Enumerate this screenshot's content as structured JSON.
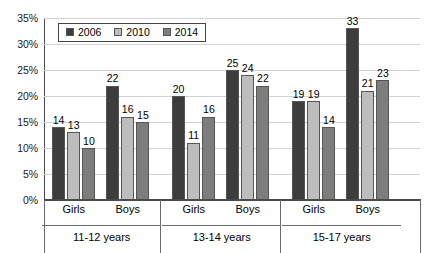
{
  "chart_data": {
    "type": "bar",
    "title": "",
    "subtitle": "",
    "xlabel": "",
    "ylabel": "",
    "ylim": [
      0,
      35
    ],
    "ytick_labels": [
      "0%",
      "5%",
      "10%",
      "15%",
      "20%",
      "25%",
      "30%",
      "35%"
    ],
    "ytick_values": [
      0,
      5,
      10,
      15,
      20,
      25,
      30,
      35
    ],
    "grid": true,
    "legend_position": "top-left-inside",
    "value_labels": true,
    "categories": [
      "Girls",
      "Boys",
      "Girls",
      "Boys",
      "Girls",
      "Boys"
    ],
    "group_labels": [
      "11-12 years",
      "13-14 years",
      "15-17 years"
    ],
    "series": [
      {
        "name": "2006",
        "color": "#3d3d3d",
        "values": [
          14,
          22,
          20,
          25,
          19,
          33
        ]
      },
      {
        "name": "2010",
        "color": "#bdbdbd",
        "values": [
          13,
          16,
          11,
          24,
          19,
          21
        ]
      },
      {
        "name": "2014",
        "color": "#7d7d7d",
        "values": [
          10,
          15,
          16,
          22,
          14,
          23
        ]
      }
    ],
    "groups": [
      {
        "age": "11-12 years",
        "sexes": [
          {
            "sex": "Girls",
            "bars": [
              {
                "year": "2006",
                "value": 14
              },
              {
                "year": "2010",
                "value": 13
              },
              {
                "year": "2014",
                "value": 10
              }
            ]
          },
          {
            "sex": "Boys",
            "bars": [
              {
                "year": "2006",
                "value": 22
              },
              {
                "year": "2010",
                "value": 16
              },
              {
                "year": "2014",
                "value": 15
              }
            ]
          }
        ]
      },
      {
        "age": "13-14 years",
        "sexes": [
          {
            "sex": "Girls",
            "bars": [
              {
                "year": "2006",
                "value": 20
              },
              {
                "year": "2010",
                "value": 11
              },
              {
                "year": "2014",
                "value": 16
              }
            ]
          },
          {
            "sex": "Boys",
            "bars": [
              {
                "year": "2006",
                "value": 25
              },
              {
                "year": "2010",
                "value": 24
              },
              {
                "year": "2014",
                "value": 22
              }
            ]
          }
        ]
      },
      {
        "age": "15-17 years",
        "sexes": [
          {
            "sex": "Girls",
            "bars": [
              {
                "year": "2006",
                "value": 19
              },
              {
                "year": "2010",
                "value": 19
              },
              {
                "year": "2014",
                "value": 14
              }
            ]
          },
          {
            "sex": "Boys",
            "bars": [
              {
                "year": "2006",
                "value": 33
              },
              {
                "year": "2010",
                "value": 21
              },
              {
                "year": "2014",
                "value": 23
              }
            ]
          }
        ]
      }
    ]
  },
  "legend": {
    "items": [
      {
        "label": "2006",
        "color": "#3d3d3d"
      },
      {
        "label": "2010",
        "color": "#bdbdbd"
      },
      {
        "label": "2014",
        "color": "#7d7d7d"
      }
    ]
  },
  "colors": {
    "series_2006": "#3d3d3d",
    "series_2010": "#bdbdbd",
    "series_2014": "#7d7d7d",
    "gridline": "#d2d2d2",
    "axis": "#4a4a4a",
    "text": "#000000",
    "background": "#ffffff"
  }
}
